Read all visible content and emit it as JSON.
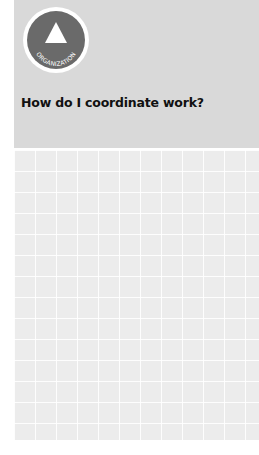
{
  "badge": {
    "icon": "triangle-icon",
    "label": "ORGANIZATION"
  },
  "header": {
    "title": "How do I coordinate work?"
  },
  "colors": {
    "header_bg": "#d9d9d9",
    "badge_bg": "#6a6a6a",
    "grid_bg": "#ececec",
    "title_text": "#111111"
  }
}
